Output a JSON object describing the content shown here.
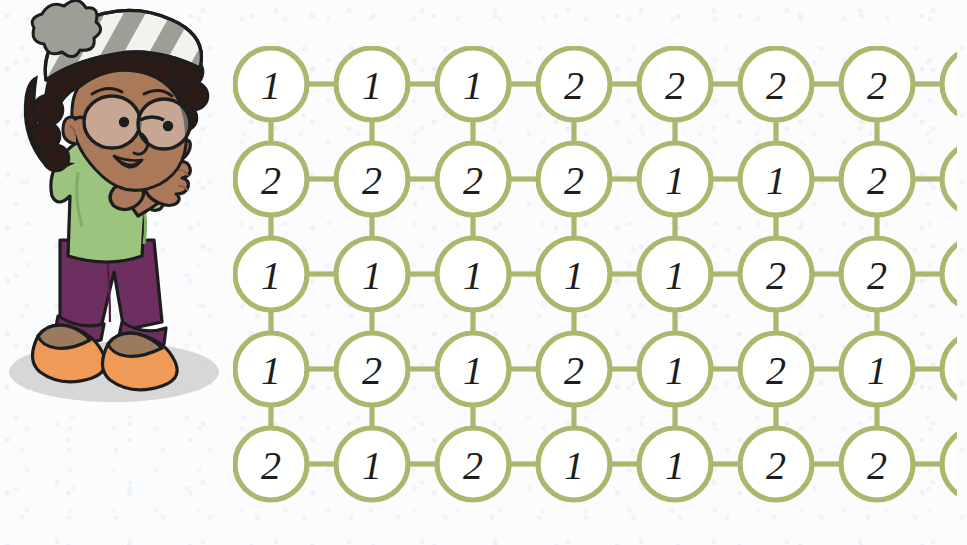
{
  "page": {
    "background_color": "#fbfcfd"
  },
  "colors": {
    "grid_green": "#a9b86d",
    "circle_fill": "#ffffff",
    "digit_ink": "#1d1d1d",
    "hat_stripe_gray": "#9e9e97",
    "hat_stripe_white": "#f2f2ef",
    "hair_dark": "#2b1b16",
    "skin": "#a9795a",
    "skin_shadow": "#8d6046",
    "shirt_green": "#9cc47f",
    "shirt_green_dark": "#7fae63",
    "pants_purple": "#6d2f60",
    "shoe_orange": "#ef9a56",
    "shoe_tan": "#9b7b5e",
    "shadow_gray": "#c9cbcb",
    "outline": "#1d1d1d"
  },
  "illustration": {
    "name": "girl-pointing-character",
    "description": "Cartoon girl wearing a striped winter beanie, round glasses, green shirt, purple pants and orange shoes, pointing toward the grid"
  },
  "grid": {
    "name": "number-bubble-grid",
    "rows": 5,
    "columns": 8,
    "cell_spacing_x": 101,
    "cell_spacing_y": 95,
    "circle_radius": 36,
    "values": [
      [
        "1",
        "1",
        "1",
        "2",
        "2",
        "2",
        "2",
        "1"
      ],
      [
        "2",
        "2",
        "2",
        "2",
        "1",
        "1",
        "2",
        "1"
      ],
      [
        "1",
        "1",
        "1",
        "1",
        "1",
        "2",
        "2",
        "1"
      ],
      [
        "1",
        "2",
        "1",
        "2",
        "1",
        "2",
        "1",
        "1"
      ],
      [
        "2",
        "1",
        "2",
        "1",
        "1",
        "2",
        "2",
        "2"
      ]
    ]
  },
  "chart_data": {
    "type": "table",
    "xlabel": "",
    "ylabel": "",
    "categories": [
      "col1",
      "col2",
      "col3",
      "col4",
      "col5",
      "col6",
      "col7",
      "col8"
    ],
    "series": [
      {
        "name": "row1",
        "values": [
          1,
          1,
          1,
          2,
          2,
          2,
          2,
          1
        ]
      },
      {
        "name": "row2",
        "values": [
          2,
          2,
          2,
          2,
          1,
          1,
          2,
          1
        ]
      },
      {
        "name": "row3",
        "values": [
          1,
          1,
          1,
          1,
          1,
          2,
          2,
          1
        ]
      },
      {
        "name": "row4",
        "values": [
          1,
          2,
          1,
          2,
          1,
          2,
          1,
          1
        ]
      },
      {
        "name": "row5",
        "values": [
          2,
          1,
          2,
          1,
          1,
          2,
          2,
          2
        ]
      }
    ]
  }
}
